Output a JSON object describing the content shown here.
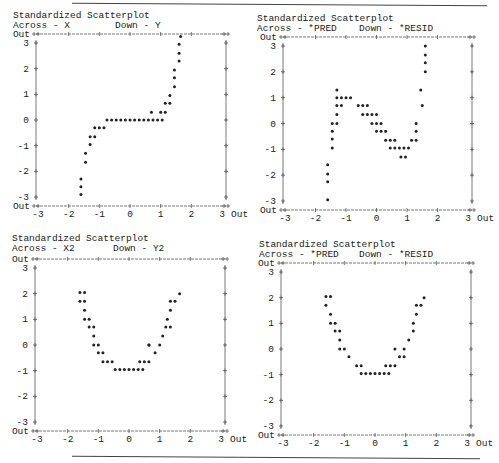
{
  "chart_data": [
    {
      "type": "scatter",
      "title": "Standardized Scatterplot",
      "across_label": "Across - X",
      "down_label": "Down - Y",
      "xlabel": "X",
      "ylabel": "Y",
      "xlim": [
        -3,
        3
      ],
      "ylim": [
        -3,
        3
      ],
      "x_ticks": [
        "-3",
        "-2",
        "-1",
        "0",
        "1",
        "2",
        "3"
      ],
      "y_ticks": [
        "3",
        "2",
        "1",
        "0",
        "-1",
        "-2",
        "-3"
      ],
      "out_label": "Out",
      "marker": "*",
      "points": [
        [
          -1.6,
          -2.9
        ],
        [
          -1.6,
          -2.6
        ],
        [
          -1.6,
          -2.3
        ],
        [
          -1.45,
          -1.65
        ],
        [
          -1.45,
          -1.3
        ],
        [
          -1.3,
          -0.95
        ],
        [
          -1.3,
          -0.65
        ],
        [
          -1.15,
          -0.65
        ],
        [
          -1.15,
          -0.3
        ],
        [
          -1.0,
          -0.3
        ],
        [
          -0.85,
          -0.3
        ],
        [
          -0.75,
          0
        ],
        [
          -0.6,
          0
        ],
        [
          -0.45,
          0
        ],
        [
          -0.3,
          0
        ],
        [
          -0.15,
          0
        ],
        [
          0,
          0
        ],
        [
          0.15,
          0
        ],
        [
          0.3,
          0
        ],
        [
          0.45,
          0
        ],
        [
          0.6,
          0
        ],
        [
          0.75,
          0
        ],
        [
          0.9,
          0
        ],
        [
          1.05,
          0
        ],
        [
          0.7,
          0.3
        ],
        [
          1.0,
          0.3
        ],
        [
          1.15,
          0.3
        ],
        [
          1.15,
          0.65
        ],
        [
          1.3,
          0.65
        ],
        [
          1.3,
          0.95
        ],
        [
          1.45,
          1.3
        ],
        [
          1.45,
          1.65
        ],
        [
          1.45,
          1.95
        ],
        [
          1.6,
          2.3
        ],
        [
          1.6,
          2.6
        ],
        [
          1.6,
          2.95
        ],
        [
          1.65,
          3.25
        ]
      ]
    },
    {
      "type": "scatter",
      "title": "Standardized Scatterplot",
      "across_label": "Across - *PRED",
      "down_label": "Down - *RESID",
      "xlabel": "*PRED",
      "ylabel": "*RESID",
      "xlim": [
        -3,
        3
      ],
      "ylim": [
        -3,
        3
      ],
      "x_ticks": [
        "-3",
        "-2",
        "-1",
        "0",
        "1",
        "2",
        "3"
      ],
      "y_ticks": [
        "3",
        "2",
        "1",
        "0",
        "-1",
        "-2",
        "-3"
      ],
      "out_label": "Out",
      "marker": "*",
      "points": [
        [
          -1.6,
          -2.95
        ],
        [
          -1.6,
          -2.25
        ],
        [
          -1.6,
          -1.95
        ],
        [
          -1.6,
          -1.6
        ],
        [
          -1.45,
          -0.95
        ],
        [
          -1.45,
          -0.6
        ],
        [
          -1.45,
          -0.3
        ],
        [
          -1.45,
          0
        ],
        [
          -1.3,
          0
        ],
        [
          -1.3,
          0.35
        ],
        [
          -1.3,
          0.7
        ],
        [
          -1.15,
          0.7
        ],
        [
          -1.3,
          1.3
        ],
        [
          -1.3,
          1.0
        ],
        [
          -1.15,
          1.0
        ],
        [
          -1.0,
          1.0
        ],
        [
          -0.85,
          1.0
        ],
        [
          -0.6,
          0.7
        ],
        [
          -0.45,
          0.7
        ],
        [
          -0.3,
          0.7
        ],
        [
          -0.45,
          0.35
        ],
        [
          -0.3,
          0.35
        ],
        [
          -0.15,
          0.35
        ],
        [
          0,
          0.35
        ],
        [
          -0.15,
          0
        ],
        [
          0,
          0
        ],
        [
          0.15,
          0
        ],
        [
          0,
          -0.3
        ],
        [
          0.15,
          -0.3
        ],
        [
          0.3,
          -0.3
        ],
        [
          0.3,
          -0.65
        ],
        [
          0.45,
          -0.65
        ],
        [
          0.6,
          -0.65
        ],
        [
          0.45,
          -0.95
        ],
        [
          0.6,
          -0.95
        ],
        [
          0.75,
          -0.95
        ],
        [
          0.9,
          -0.95
        ],
        [
          1.05,
          -0.95
        ],
        [
          0.8,
          -1.3
        ],
        [
          0.95,
          -1.3
        ],
        [
          1.15,
          -0.65
        ],
        [
          1.3,
          -0.65
        ],
        [
          1.3,
          -0.3
        ],
        [
          1.3,
          0
        ],
        [
          1.5,
          0.7
        ],
        [
          1.45,
          1.3
        ],
        [
          1.6,
          2.0
        ],
        [
          1.6,
          2.35
        ],
        [
          1.6,
          2.65
        ],
        [
          1.6,
          3.0
        ]
      ]
    },
    {
      "type": "scatter",
      "title": "Standardized Scatterplot",
      "across_label": "Across - X2",
      "down_label": "Down - Y2",
      "xlabel": "X2",
      "ylabel": "Y2",
      "xlim": [
        -3,
        3
      ],
      "ylim": [
        -3,
        3
      ],
      "x_ticks": [
        "-3",
        "-2",
        "-1",
        "0",
        "1",
        "2",
        "3"
      ],
      "y_ticks": [
        "3",
        "2",
        "1",
        "0",
        "-1",
        "-2",
        "-3"
      ],
      "out_label": "Out",
      "marker": "*",
      "points": [
        [
          -1.6,
          2.05
        ],
        [
          -1.45,
          2.05
        ],
        [
          -1.6,
          1.7
        ],
        [
          -1.45,
          1.7
        ],
        [
          -1.45,
          1.35
        ],
        [
          -1.45,
          1.0
        ],
        [
          -1.3,
          1.0
        ],
        [
          -1.3,
          0.7
        ],
        [
          -1.15,
          0.7
        ],
        [
          -1.15,
          0.35
        ],
        [
          -1.15,
          0
        ],
        [
          -1.0,
          0
        ],
        [
          -1.0,
          -0.3
        ],
        [
          -0.85,
          -0.3
        ],
        [
          -0.85,
          -0.65
        ],
        [
          -0.7,
          -0.65
        ],
        [
          -0.55,
          -0.65
        ],
        [
          -0.45,
          -0.95
        ],
        [
          -0.3,
          -0.95
        ],
        [
          -0.15,
          -0.95
        ],
        [
          0,
          -0.95
        ],
        [
          0.15,
          -0.95
        ],
        [
          0.3,
          -0.95
        ],
        [
          0.45,
          -0.95
        ],
        [
          0.35,
          -0.65
        ],
        [
          0.5,
          -0.65
        ],
        [
          0.65,
          -0.65
        ],
        [
          0.85,
          -0.3
        ],
        [
          0.65,
          0
        ],
        [
          1.0,
          0
        ],
        [
          0.65,
          0
        ],
        [
          1.1,
          0.35
        ],
        [
          1.2,
          0.7
        ],
        [
          1.35,
          0.7
        ],
        [
          1.25,
          1.0
        ],
        [
          1.35,
          1.35
        ],
        [
          1.35,
          1.7
        ],
        [
          1.5,
          1.7
        ],
        [
          1.65,
          2.0
        ]
      ]
    },
    {
      "type": "scatter",
      "title": "Standardized Scatterplot",
      "across_label": "Across - *PRED",
      "down_label": "Down - *RESID",
      "xlabel": "*PRED",
      "ylabel": "*RESID",
      "xlim": [
        -3,
        3
      ],
      "ylim": [
        -3,
        3
      ],
      "x_ticks": [
        "-3",
        "-2",
        "-1",
        "0",
        "1",
        "2",
        "3"
      ],
      "y_ticks": [
        "3",
        "2",
        "1",
        "0",
        "-1",
        "-2",
        "-3"
      ],
      "out_label": "Out",
      "marker": "*",
      "points": [
        [
          -1.6,
          2.05
        ],
        [
          -1.45,
          2.05
        ],
        [
          -1.6,
          1.7
        ],
        [
          -1.45,
          1.35
        ],
        [
          -1.45,
          1.0
        ],
        [
          -1.3,
          1.0
        ],
        [
          -1.3,
          0.7
        ],
        [
          -1.15,
          0.7
        ],
        [
          -1.15,
          0.35
        ],
        [
          -1.15,
          0
        ],
        [
          -1.0,
          0
        ],
        [
          -0.85,
          -0.3
        ],
        [
          -0.6,
          -0.65
        ],
        [
          -0.45,
          -0.65
        ],
        [
          -0.45,
          -0.95
        ],
        [
          -0.3,
          -0.95
        ],
        [
          -0.15,
          -0.95
        ],
        [
          0,
          -0.95
        ],
        [
          0.15,
          -0.95
        ],
        [
          0.3,
          -0.95
        ],
        [
          0.45,
          -0.95
        ],
        [
          0.35,
          -0.65
        ],
        [
          0.5,
          -0.65
        ],
        [
          0.65,
          -0.65
        ],
        [
          0.8,
          -0.3
        ],
        [
          0.95,
          -0.3
        ],
        [
          0.65,
          0
        ],
        [
          0.95,
          0
        ],
        [
          1.1,
          0.35
        ],
        [
          1.25,
          0.7
        ],
        [
          1.25,
          1.0
        ],
        [
          1.35,
          1.35
        ],
        [
          1.35,
          1.7
        ],
        [
          1.5,
          1.7
        ],
        [
          1.6,
          2.0
        ]
      ]
    }
  ],
  "panels": [
    {
      "title": "Standardized Scatterplot",
      "across": "Across - X",
      "down": "Down - Y",
      "out": "Out",
      "out_right": "3 Out"
    },
    {
      "title": "Standardized Scatterplot",
      "across": "Across - *PRED",
      "down": "Down - *RESID",
      "out": "Out",
      "out_right": "3 Out"
    },
    {
      "title": "Standardized Scatterplot",
      "across": "Across - X2",
      "down": "Down - Y2",
      "out": "Out",
      "out_right": "3 Out"
    },
    {
      "title": "Standardized Scatterplot",
      "across": "Across - *PRED",
      "down": "Down - *RESID",
      "out": "Out",
      "out_right": "3 Out"
    }
  ]
}
